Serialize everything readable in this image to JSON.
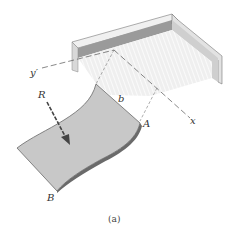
{
  "figure": {
    "caption": "(a)",
    "labels": {
      "y_axis": "y′",
      "x_axis": "x",
      "resultant": "R",
      "width": "b",
      "point_a": "A",
      "point_b": "B"
    }
  },
  "colors": {
    "plate_fill": "#c8c8c8",
    "plate_edge": "#6a6a6a",
    "wall_dark": "#9a9a9a",
    "wall_light": "#e6e6e6",
    "floor_shade": "#ececec",
    "dash_line": "#555555",
    "arrow": "#444444"
  }
}
